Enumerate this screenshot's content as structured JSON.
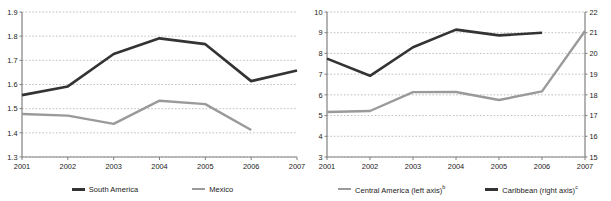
{
  "figure": {
    "background": "#ffffff",
    "panels": 2
  },
  "colors": {
    "dark_series": "#333333",
    "gray_series": "#9a9a9a",
    "axis": "#808080",
    "grid": "#b0b0b0",
    "text": "#1a1a1a"
  },
  "chart_data": [
    {
      "type": "line",
      "title": "",
      "subtitle": "",
      "xlabel": "",
      "ylabel": "",
      "x": [
        "2001",
        "2002",
        "2003",
        "2004",
        "2005",
        "2006",
        "2007"
      ],
      "ylim": [
        1.3,
        1.9
      ],
      "yticks": [
        "1.3",
        "1.4",
        "1.5",
        "1.6",
        "1.7",
        "1.8",
        "1.9"
      ],
      "grid": true,
      "legend_position": "bottom",
      "series": [
        {
          "name": "South America",
          "color": "#333333",
          "width": 2.6,
          "values": [
            1.556,
            1.592,
            1.726,
            1.791,
            1.767,
            1.614,
            1.658
          ]
        },
        {
          "name": "Mexico",
          "color": "#9a9a9a",
          "width": 2.4,
          "values": [
            1.478,
            1.471,
            1.437,
            1.533,
            1.519,
            1.412,
            null
          ]
        }
      ]
    },
    {
      "type": "line",
      "title": "",
      "subtitle": "",
      "xlabel": "",
      "ylabel": "",
      "x": [
        "2001",
        "2002",
        "2003",
        "2004",
        "2005",
        "2006",
        "2007"
      ],
      "ylim": [
        3,
        10
      ],
      "yticks": [
        "3",
        "4",
        "5",
        "6",
        "7",
        "8",
        "9",
        "10"
      ],
      "y2lim": [
        15,
        22
      ],
      "y2ticks": [
        "15",
        "16",
        "17",
        "18",
        "19",
        "20",
        "21",
        "22"
      ],
      "grid": true,
      "legend_position": "bottom",
      "series": [
        {
          "name": "Central America (left axis)",
          "footnote": "b",
          "axis": "left",
          "color": "#9a9a9a",
          "width": 2.4,
          "values": [
            5.17,
            5.22,
            6.13,
            6.14,
            5.75,
            6.17,
            9.08
          ]
        },
        {
          "name": "Caribbean (right axis)",
          "footnote": "c",
          "axis": "right",
          "color": "#333333",
          "width": 2.6,
          "values": [
            19.75,
            18.92,
            20.3,
            21.15,
            20.87,
            21.0,
            null
          ]
        }
      ]
    }
  ],
  "legends": {
    "left_panel": [
      {
        "label": "South America",
        "footnote": "",
        "color": "#333333",
        "thickness": "thick"
      },
      {
        "label": "Mexico",
        "footnote": "",
        "color": "#9a9a9a",
        "thickness": "thin"
      }
    ],
    "right_panel": [
      {
        "label": "Central America (left axis)",
        "footnote": "b",
        "color": "#9a9a9a",
        "thickness": "thin"
      },
      {
        "label": "Caribbean (right axis)",
        "footnote": "c",
        "color": "#333333",
        "thickness": "thick"
      }
    ]
  }
}
